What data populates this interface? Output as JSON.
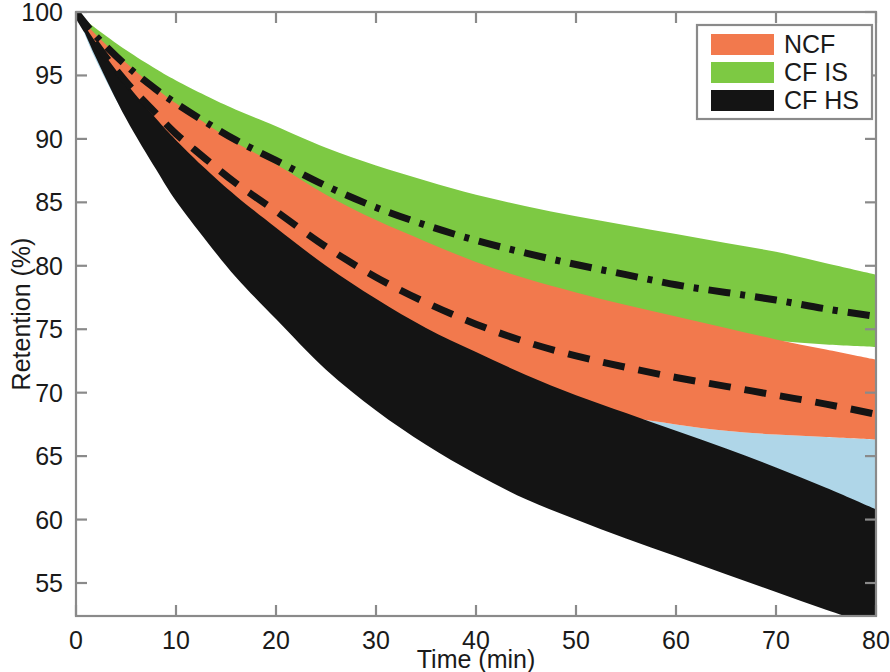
{
  "chart_data": {
    "type": "area",
    "title": "",
    "xlabel": "Time (min)",
    "ylabel": "Retention (%)",
    "xlim": [
      0,
      80
    ],
    "ylim": [
      52.4,
      100
    ],
    "xticks": [
      0,
      10,
      20,
      30,
      40,
      50,
      60,
      70,
      80
    ],
    "yticks": [
      55,
      60,
      65,
      70,
      75,
      80,
      85,
      90,
      95,
      100
    ],
    "xtick_labels": [
      "0",
      "10",
      "20",
      "30",
      "40",
      "50",
      "60",
      "70",
      "80"
    ],
    "ytick_labels": [
      "55",
      "60",
      "65",
      "70",
      "75",
      "80",
      "85",
      "90",
      "95",
      "100"
    ],
    "grid": false,
    "legend_position": "top-right",
    "legend_entries": [
      {
        "label": "NCF",
        "color": "#F2794D"
      },
      {
        "label": "CF IS",
        "color": "#7DC943"
      },
      {
        "label": "CF HS",
        "color": "#141414"
      }
    ],
    "x": [
      0,
      2,
      5,
      8,
      10,
      13,
      16,
      20,
      25,
      30,
      35,
      40,
      45,
      50,
      55,
      60,
      65,
      70,
      75,
      80
    ],
    "series": [
      {
        "name": "CF IS",
        "color": "#7DC943",
        "linestyle": "dashdot",
        "upper": [
          100.0,
          98.7,
          97.0,
          95.5,
          94.6,
          93.4,
          92.3,
          91.0,
          89.3,
          87.9,
          86.7,
          85.6,
          84.7,
          83.9,
          83.2,
          82.5,
          81.8,
          81.1,
          80.2,
          79.3
        ],
        "mean": [
          100.0,
          98.1,
          95.8,
          93.9,
          92.8,
          91.3,
          89.9,
          88.3,
          86.3,
          84.6,
          83.2,
          82.0,
          81.0,
          80.1,
          79.3,
          78.5,
          77.9,
          77.3,
          76.6,
          76.0
        ],
        "lower": [
          100.0,
          97.5,
          94.6,
          92.3,
          90.9,
          89.1,
          87.5,
          85.6,
          83.3,
          81.4,
          79.8,
          78.5,
          77.4,
          76.5,
          75.7,
          75.0,
          74.5,
          74.1,
          73.8,
          73.6
        ]
      },
      {
        "name": "NCF",
        "color": "#F2794D",
        "linestyle": "dashed",
        "upper": [
          100.0,
          98.2,
          96.0,
          94.0,
          92.8,
          91.2,
          89.7,
          88.0,
          85.6,
          83.6,
          81.9,
          80.3,
          79.0,
          77.9,
          76.9,
          76.0,
          75.1,
          74.2,
          73.4,
          72.6
        ],
        "mean": [
          100.0,
          97.5,
          94.5,
          92.0,
          90.4,
          88.4,
          86.5,
          84.3,
          81.5,
          79.1,
          77.1,
          75.4,
          74.0,
          72.9,
          72.0,
          71.2,
          70.5,
          69.8,
          69.1,
          68.3
        ],
        "lower": [
          100.0,
          96.8,
          93.0,
          89.9,
          88.1,
          85.7,
          83.5,
          81.0,
          77.8,
          75.2,
          73.1,
          71.4,
          70.0,
          68.9,
          68.1,
          67.5,
          67.0,
          66.7,
          66.5,
          66.3
        ]
      },
      {
        "name": "CF HS",
        "color": "#141414",
        "linestyle": "solid",
        "upper": [
          100.0,
          97.6,
          94.4,
          91.6,
          89.9,
          87.6,
          85.5,
          83.0,
          80.0,
          77.4,
          75.1,
          73.2,
          71.4,
          69.8,
          68.4,
          67.0,
          65.6,
          64.1,
          62.5,
          60.8
        ],
        "mean": [
          100.0,
          97.0,
          93.0,
          89.6,
          87.5,
          84.8,
          82.3,
          79.4,
          75.9,
          73.0,
          70.5,
          68.4,
          66.5,
          64.9,
          63.4,
          62.0,
          60.6,
          59.2,
          57.7,
          56.2
        ],
        "lower": [
          100.0,
          96.4,
          91.6,
          87.6,
          85.1,
          82.0,
          79.1,
          75.8,
          71.8,
          68.6,
          65.9,
          63.6,
          61.6,
          60.0,
          58.5,
          57.1,
          55.7,
          54.3,
          52.9,
          51.6
        ]
      },
      {
        "name": "overlap-band",
        "color": "#AFD6E8",
        "linestyle": "none",
        "upper": [
          100.0,
          96.8,
          93.0,
          89.9,
          88.1,
          85.7,
          83.5,
          81.0,
          77.8,
          75.2,
          73.1,
          71.4,
          70.0,
          68.9,
          68.1,
          67.5,
          67.0,
          66.7,
          66.5,
          66.3
        ],
        "lower": [
          100.0,
          96.2,
          91.7,
          88.1,
          85.9,
          83.2,
          80.7,
          77.8,
          74.3,
          71.3,
          68.8,
          66.7,
          64.9,
          63.4,
          62.1,
          60.9,
          59.8,
          58.8,
          57.9,
          57.1
        ]
      }
    ]
  },
  "axes": {
    "y_axis_title": "Retention (%)",
    "x_axis_title": "Time (min)"
  },
  "legend": {
    "items": [
      {
        "label": "NCF",
        "swatch_color": "#F2794D"
      },
      {
        "label": "CF IS",
        "swatch_color": "#7DC943"
      },
      {
        "label": "CF HS",
        "swatch_color": "#141414"
      }
    ]
  },
  "colors": {
    "ncf": "#F2794D",
    "cf_is": "#7DC943",
    "cf_hs": "#141414",
    "overlap": "#AFD6E8",
    "axis": "#8a8a8a",
    "text": "#1a1a1a",
    "background": "#ffffff"
  }
}
